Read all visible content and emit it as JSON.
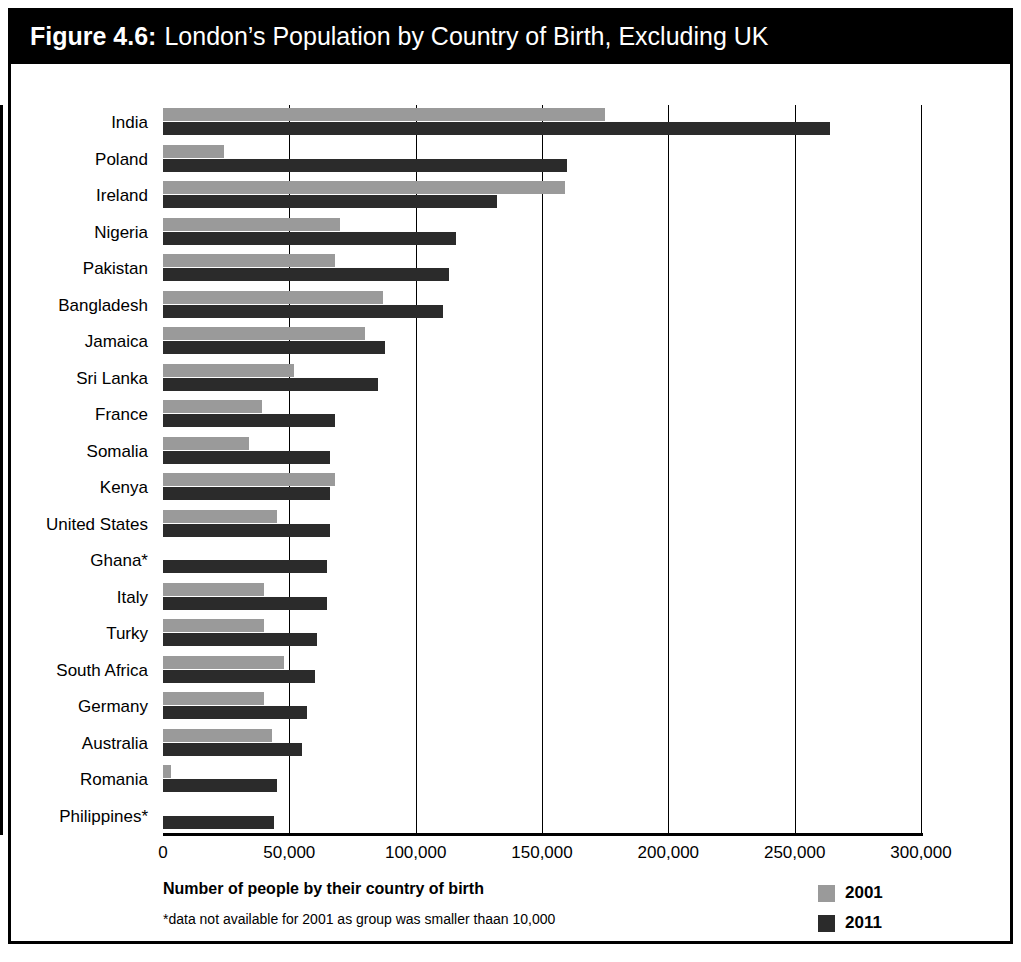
{
  "figure": {
    "number_label": "Figure 4.6:",
    "title": "London’s Population by Country of Birth, Excluding UK"
  },
  "axis_caption": "Number of people by their country of birth",
  "footnote": "*data not available for 2001 as group was smaller thaan 10,000",
  "legend": {
    "position": "bottom-right",
    "items": [
      {
        "label": "2001",
        "color": "#9a9a9a"
      },
      {
        "label": "2011",
        "color": "#2b2b2b"
      }
    ]
  },
  "colors": {
    "series_2001": "#9a9a9a",
    "series_2011": "#2b2b2b",
    "title_bar_background": "#000000",
    "title_bar_text": "#ffffff",
    "frame": "#000000"
  },
  "chart_data": {
    "type": "bar",
    "orientation": "horizontal",
    "title": "London’s Population by Country of Birth, Excluding UK",
    "xlabel": "Number of people by their country of birth",
    "ylabel": "",
    "xlim": [
      0,
      300000
    ],
    "xticks": [
      0,
      50000,
      100000,
      150000,
      200000,
      250000,
      300000
    ],
    "xtick_labels": [
      "0",
      "50,000",
      "100,000",
      "150,000",
      "200,000",
      "250,000",
      "300,000"
    ],
    "grid": true,
    "legend_position": "bottom-right",
    "categories": [
      "India",
      "Poland",
      "Ireland",
      "Nigeria",
      "Pakistan",
      "Bangladesh",
      "Jamaica",
      "Sri Lanka",
      "France",
      "Somalia",
      "Kenya",
      "United States",
      "Ghana*",
      "Italy",
      "Turky",
      "South Africa",
      "Germany",
      "Australia",
      "Romania",
      "Philippines*"
    ],
    "series": [
      {
        "name": "2001",
        "color": "#9a9a9a",
        "values": [
          175000,
          24000,
          159000,
          70000,
          68000,
          87000,
          80000,
          52000,
          39000,
          34000,
          68000,
          45000,
          null,
          40000,
          40000,
          48000,
          40000,
          43000,
          3000,
          null
        ]
      },
      {
        "name": "2011",
        "color": "#2b2b2b",
        "values": [
          264000,
          160000,
          132000,
          116000,
          113000,
          111000,
          88000,
          85000,
          68000,
          66000,
          66000,
          66000,
          65000,
          65000,
          61000,
          60000,
          57000,
          55000,
          45000,
          44000
        ]
      }
    ]
  }
}
